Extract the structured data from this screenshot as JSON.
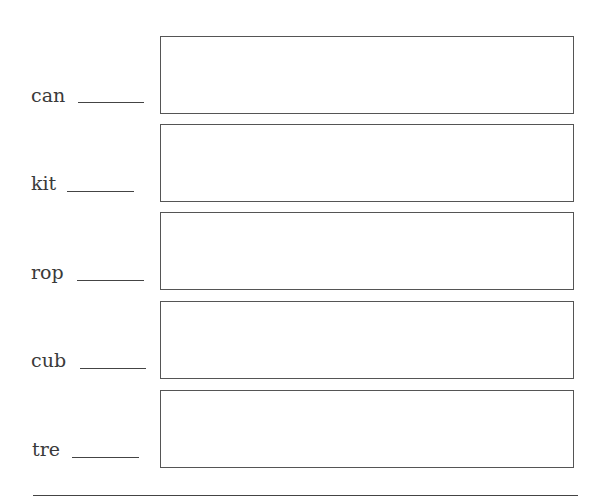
{
  "worksheet": {
    "rows": [
      {
        "word": "can"
      },
      {
        "word": "kit"
      },
      {
        "word": "rop"
      },
      {
        "word": "cub"
      },
      {
        "word": "tre"
      }
    ]
  }
}
